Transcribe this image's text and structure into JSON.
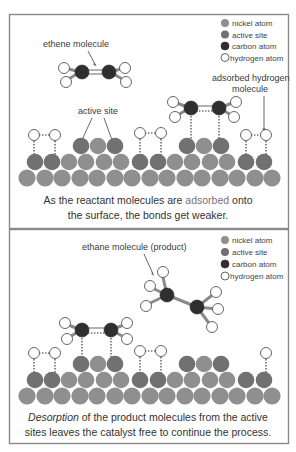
{
  "colors": {
    "nickel": "#8f8f8f",
    "active_site": "#717171",
    "carbon": "#2f2f2f",
    "hydrogen": "#ffffff",
    "adsorbed_word": "#7a6f80",
    "border": "#8a8a8a"
  },
  "legend": [
    {
      "key": "nickel",
      "label": "nickel atom"
    },
    {
      "key": "active_site",
      "label": "active site"
    },
    {
      "key": "carbon",
      "label": "carbon atom"
    },
    {
      "key": "hydrogen",
      "label": "hydrogen atom"
    }
  ],
  "top_panel": {
    "labels": {
      "ethene": "ethene molecule",
      "active_site": "active site",
      "adsorbed_h_line1": "adsorbed hydrogen",
      "adsorbed_h_line2": "molecule"
    },
    "caption": {
      "line1_pre": "As the reactant molecules are ",
      "line1_highlight": "adsorbed",
      "line1_post": " onto",
      "line2": "the surface, the bonds get weaker."
    }
  },
  "bottom_panel": {
    "labels": {
      "ethane": "ethane molecule (product)"
    },
    "caption": {
      "line1_italic": "Desorption",
      "line1_rest": " of the product molecules from the active",
      "line2": "sites leaves the catalyst free to continue the process."
    }
  }
}
